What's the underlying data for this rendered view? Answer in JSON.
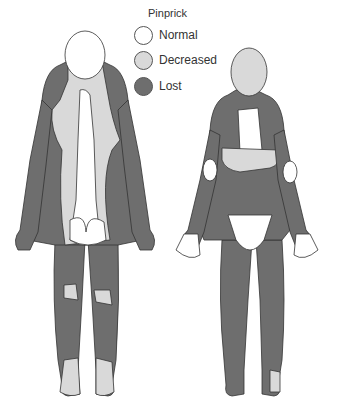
{
  "legend": {
    "title": "Pinprick",
    "items": [
      {
        "label": "Normal",
        "color": "#ffffff"
      },
      {
        "label": "Decreased",
        "color": "#d9d9d9"
      },
      {
        "label": "Lost",
        "color": "#6e6e6e"
      }
    ]
  },
  "figures": [
    {
      "view": "posterior"
    },
    {
      "view": "anterior"
    }
  ],
  "colors": {
    "outline": "#333333",
    "normal": "#ffffff",
    "decreased": "#d9d9d9",
    "lost": "#6e6e6e"
  }
}
